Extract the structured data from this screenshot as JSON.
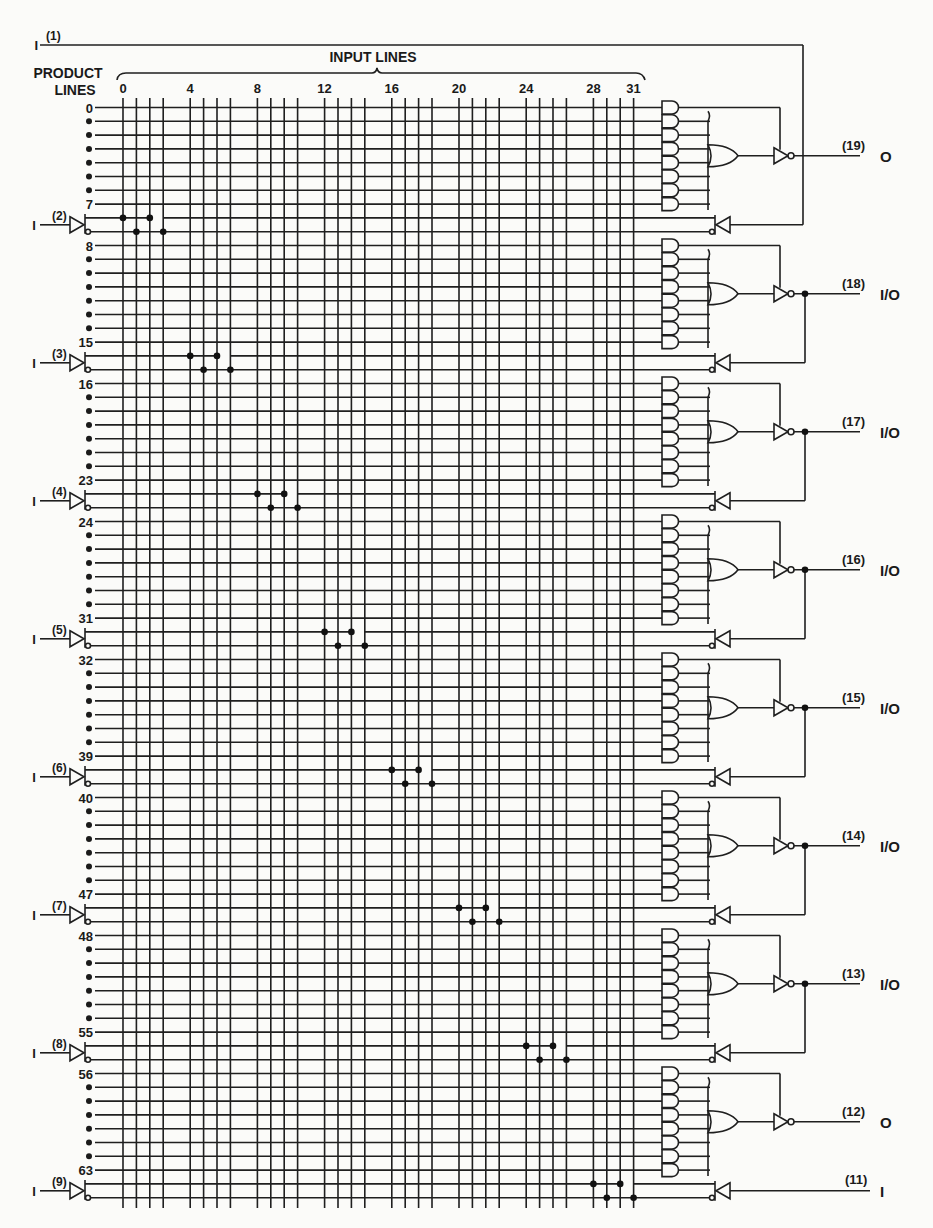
{
  "header": {
    "input_lines_label": "INPUT LINES",
    "product_lines_label": [
      "PRODUCT",
      "LINES"
    ],
    "column_ticks": [
      "0",
      "4",
      "8",
      "12",
      "16",
      "20",
      "24",
      "28",
      "31"
    ],
    "column_tick_indices": [
      0,
      4,
      8,
      12,
      16,
      20,
      24,
      28,
      31
    ]
  },
  "grid": {
    "input_line_count": 32,
    "product_line_count": 64,
    "row_labels": [
      {
        "row": 0,
        "label": "0"
      },
      {
        "row": 7,
        "label": "7"
      },
      {
        "row": 8,
        "label": "8"
      },
      {
        "row": 15,
        "label": "15"
      },
      {
        "row": 16,
        "label": "16"
      },
      {
        "row": 23,
        "label": "23"
      },
      {
        "row": 24,
        "label": "24"
      },
      {
        "row": 31,
        "label": "31"
      },
      {
        "row": 32,
        "label": "32"
      },
      {
        "row": 39,
        "label": "39"
      },
      {
        "row": 40,
        "label": "40"
      },
      {
        "row": 47,
        "label": "47"
      },
      {
        "row": 48,
        "label": "48"
      },
      {
        "row": 55,
        "label": "55"
      },
      {
        "row": 56,
        "label": "56"
      },
      {
        "row": 63,
        "label": "63"
      }
    ]
  },
  "input_pins": [
    {
      "pin": "(2)",
      "type": "I",
      "cols": [
        0,
        1,
        2,
        3
      ]
    },
    {
      "pin": "(3)",
      "type": "I",
      "cols": [
        4,
        5,
        6,
        7
      ]
    },
    {
      "pin": "(4)",
      "type": "I",
      "cols": [
        8,
        9,
        10,
        11
      ]
    },
    {
      "pin": "(5)",
      "type": "I",
      "cols": [
        12,
        13,
        14,
        15
      ]
    },
    {
      "pin": "(6)",
      "type": "I",
      "cols": [
        16,
        17,
        18,
        19
      ]
    },
    {
      "pin": "(7)",
      "type": "I",
      "cols": [
        20,
        21,
        22,
        23
      ]
    },
    {
      "pin": "(8)",
      "type": "I",
      "cols": [
        24,
        25,
        26,
        27
      ]
    },
    {
      "pin": "(9)",
      "type": "I",
      "cols": [
        28,
        29,
        30,
        31
      ]
    }
  ],
  "top_input": {
    "pin": "(1)",
    "type": "I"
  },
  "outputs": [
    {
      "pin": "(19)",
      "type": "O",
      "feedback": false
    },
    {
      "pin": "(18)",
      "type": "I/O",
      "feedback": true
    },
    {
      "pin": "(17)",
      "type": "I/O",
      "feedback": true
    },
    {
      "pin": "(16)",
      "type": "I/O",
      "feedback": true
    },
    {
      "pin": "(15)",
      "type": "I/O",
      "feedback": true
    },
    {
      "pin": "(14)",
      "type": "I/O",
      "feedback": true
    },
    {
      "pin": "(13)",
      "type": "I/O",
      "feedback": true
    },
    {
      "pin": "(12)",
      "type": "O",
      "feedback": false
    }
  ],
  "bottom_input": {
    "pin": "(11)",
    "type": "I"
  }
}
